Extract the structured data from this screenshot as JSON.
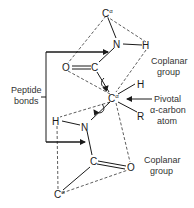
{
  "diagram": {
    "atoms": {
      "calpha_top": "C",
      "n_top": "N",
      "h_top": "H",
      "o_top": "O",
      "c_top": "C",
      "calpha_center": "C",
      "h_center": "H",
      "r_group": "R",
      "h_lower": "H",
      "n_lower": "N",
      "c_lower": "C",
      "o_lower": "O",
      "calpha_bottom": "C",
      "alpha_superscript": "α"
    },
    "labels": {
      "coplanar_top_line1": "Coplanar",
      "coplanar_top_line2": "group",
      "coplanar_bottom_line1": "Coplanar",
      "coplanar_bottom_line2": "group",
      "peptide_line1": "Peptide",
      "peptide_line2": "bonds",
      "pivotal_line1": "Pivotal",
      "pivotal_line2": "α-carbon",
      "pivotal_line3": "atom"
    }
  }
}
